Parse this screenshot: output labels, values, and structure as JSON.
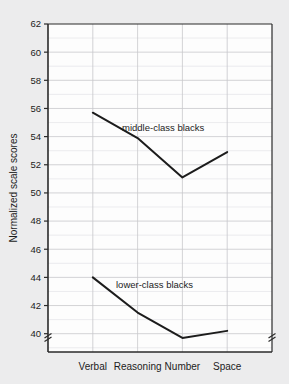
{
  "chart_data": {
    "type": "line",
    "title": "",
    "xlabel": "",
    "ylabel": "Normalized scale scores",
    "categories": [
      "Verbal",
      "Reasoning",
      "Number",
      "Space"
    ],
    "series": [
      {
        "name": "middle-class blacks",
        "values": [
          55.7,
          53.9,
          51.1,
          52.9
        ]
      },
      {
        "name": "lower-class blacks",
        "values": [
          44.0,
          41.5,
          39.7,
          40.2
        ]
      }
    ],
    "ylim": [
      38.7,
      62
    ],
    "yticks": [
      40,
      42,
      44,
      46,
      48,
      50,
      52,
      54,
      56,
      58,
      60,
      62
    ],
    "ytick_labels": [
      "40",
      "42",
      "44",
      "46",
      "48",
      "50",
      "52",
      "54",
      "56",
      "58",
      "60",
      "62"
    ],
    "grid": true,
    "minor_grid": true,
    "legend": "inline-annotations",
    "axis_break": true,
    "annotations": [
      {
        "text": "middle-class blacks",
        "series": "middle-class blacks"
      },
      {
        "text": "lower-class blacks",
        "series": "lower-class blacks"
      }
    ],
    "colors": {
      "line": "#1c1c1c",
      "plot_background": "#fdfdfd",
      "page_background": "#ececed",
      "grid": "#c8c8cc",
      "minor_grid": "#e4e4e8",
      "axis": "#2a2a2a",
      "text": "#1c1c1c"
    }
  }
}
